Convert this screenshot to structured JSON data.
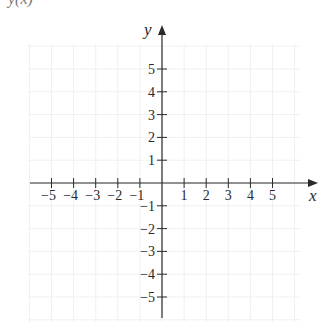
{
  "caption_fragment": "y(x)",
  "chart_data": {
    "type": "line",
    "title": "",
    "xlabel": "x",
    "ylabel": "y",
    "x_ticks": [
      -5,
      -4,
      -3,
      -2,
      -1,
      1,
      2,
      3,
      4,
      5
    ],
    "y_ticks": [
      5,
      4,
      3,
      2,
      1,
      -1,
      -2,
      -3,
      -4,
      -5
    ],
    "xlim": [
      -6,
      7
    ],
    "ylim": [
      -6,
      7
    ],
    "grid": true,
    "series": []
  },
  "style": {
    "axis_color": "#2a2a2a",
    "grid_color": "#f0f0f0"
  }
}
